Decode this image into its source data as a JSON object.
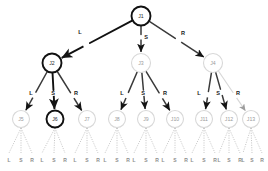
{
  "diagram": {
    "colors": {
      "highlight": "#111111",
      "normal": "#3a3a3a",
      "faint": "#d8d8d8",
      "faint_text": "#9a9a9a",
      "dotted": "#c2c2c2",
      "bottom_label": "#8e8e8e"
    },
    "edge_labels": {
      "left": "L",
      "straight": "S",
      "right": "R"
    },
    "nodes": [
      {
        "id": "J1",
        "label": "J1",
        "x": 141,
        "y": 16,
        "r": 9.5,
        "style": "highlight"
      },
      {
        "id": "J2",
        "label": "J2",
        "x": 52,
        "y": 63,
        "r": 9.5,
        "style": "highlight"
      },
      {
        "id": "J3",
        "label": "J3",
        "x": 141,
        "y": 63,
        "r": 9.5,
        "style": "faint"
      },
      {
        "id": "J4",
        "label": "J4",
        "x": 213,
        "y": 63,
        "r": 9.5,
        "style": "faint"
      },
      {
        "id": "J5",
        "label": "J5",
        "x": 21,
        "y": 119,
        "r": 8.5,
        "style": "faint"
      },
      {
        "id": "J6",
        "label": "J6",
        "x": 55,
        "y": 119,
        "r": 8.5,
        "style": "highlight"
      },
      {
        "id": "J7",
        "label": "J7",
        "x": 87,
        "y": 119,
        "r": 8.5,
        "style": "faint"
      },
      {
        "id": "J8",
        "label": "J8",
        "x": 117,
        "y": 119,
        "r": 8.5,
        "style": "faint"
      },
      {
        "id": "J9",
        "label": "J9",
        "x": 146,
        "y": 119,
        "r": 8.5,
        "style": "faint"
      },
      {
        "id": "J10",
        "label": "J10",
        "x": 175,
        "y": 119,
        "r": 8.5,
        "style": "faint"
      },
      {
        "id": "J11",
        "label": "J11",
        "x": 204,
        "y": 119,
        "r": 8.5,
        "style": "faint"
      },
      {
        "id": "J12",
        "label": "J12",
        "x": 229,
        "y": 119,
        "r": 8.5,
        "style": "faint"
      },
      {
        "id": "J13",
        "label": "J13",
        "x": 251,
        "y": 119,
        "r": 8.5,
        "style": "faint"
      }
    ],
    "edges": [
      {
        "from": "J1",
        "to": "J2",
        "label": "L",
        "label_x": 80,
        "label_y": 32,
        "style": "highlight"
      },
      {
        "from": "J1",
        "to": "J3",
        "label": "S",
        "label_x": 146,
        "label_y": 37,
        "style": "normal"
      },
      {
        "from": "J1",
        "to": "J4",
        "label": "R",
        "label_x": 183,
        "label_y": 33,
        "style": "normal"
      },
      {
        "from": "J2",
        "to": "J5",
        "label": "L",
        "label_x": 31,
        "label_y": 93,
        "style": "normal"
      },
      {
        "from": "J2",
        "to": "J6",
        "label": "S",
        "label_x": 53,
        "label_y": 93,
        "style": "highlight"
      },
      {
        "from": "J2",
        "to": "J7",
        "label": "R",
        "label_x": 76,
        "label_y": 93,
        "style": "normal"
      },
      {
        "from": "J3",
        "to": "J8",
        "label": "L",
        "label_x": 122,
        "label_y": 93,
        "style": "normal"
      },
      {
        "from": "J3",
        "to": "J9",
        "label": "S",
        "label_x": 143,
        "label_y": 93,
        "style": "normal"
      },
      {
        "from": "J3",
        "to": "J10",
        "label": "R",
        "label_x": 165,
        "label_y": 93,
        "style": "normal"
      },
      {
        "from": "J4",
        "to": "J11",
        "label": "L",
        "label_x": 199,
        "label_y": 93,
        "style": "normal"
      },
      {
        "from": "J4",
        "to": "J12",
        "label": "S",
        "label_x": 218,
        "label_y": 93,
        "style": "normal"
      },
      {
        "from": "J4",
        "to": "J13",
        "label": "R",
        "label_x": 238,
        "label_y": 93,
        "style": "faint"
      }
    ],
    "leaf_fans": [
      {
        "parent": "J5",
        "cx": 21,
        "labels": [
          "L",
          "S",
          "R"
        ],
        "label_x": [
          9,
          21,
          32
        ]
      },
      {
        "parent": "J6",
        "cx": 55,
        "labels": [
          "L",
          "S",
          "R"
        ],
        "label_x": [
          42,
          54,
          65
        ]
      },
      {
        "parent": "J7",
        "cx": 87,
        "labels": [
          "L",
          "S",
          "R"
        ],
        "label_x": [
          75,
          87,
          98
        ]
      },
      {
        "parent": "J8",
        "cx": 117,
        "labels": [
          "L",
          "S",
          "R"
        ],
        "label_x": [
          105,
          117,
          128
        ]
      },
      {
        "parent": "J9",
        "cx": 146,
        "labels": [
          "L",
          "S",
          "R"
        ],
        "label_x": [
          134,
          146,
          157
        ]
      },
      {
        "parent": "J10",
        "cx": 175,
        "labels": [
          "L",
          "S",
          "R"
        ],
        "label_x": [
          163,
          175,
          186
        ]
      },
      {
        "parent": "J11",
        "cx": 204,
        "labels": [
          "L",
          "S",
          "R"
        ],
        "label_x": [
          192,
          204,
          215
        ]
      },
      {
        "parent": "J12",
        "cx": 229,
        "labels": [
          "L",
          "S",
          "R"
        ],
        "label_x": [
          219,
          229,
          240
        ]
      },
      {
        "parent": "J13",
        "cx": 251,
        "labels": [
          "L",
          "S",
          "R"
        ],
        "label_x": [
          243,
          252,
          262
        ]
      }
    ],
    "fan_label_y": 160,
    "fan_top_y": 128,
    "fan_bottom_y": 153
  }
}
